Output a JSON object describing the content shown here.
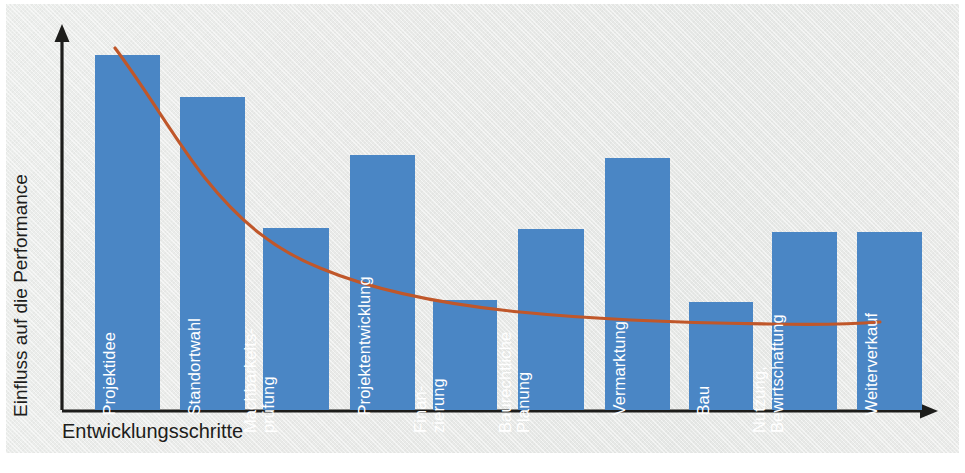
{
  "figure": {
    "background_color": "#e8e9e7",
    "bar_color": "#4a86c5",
    "curve_color": "#c0572a",
    "axis_color": "#1d1d1b",
    "label_color": "#ffffff"
  },
  "axes": {
    "ylabel": "Einfluss auf die Performance",
    "xlabel": "Entwicklungsschritte"
  },
  "chart_data": {
    "type": "bar",
    "title": "",
    "xlabel": "Entwicklungsschritte",
    "ylabel": "Einfluss auf die Performance",
    "grid": false,
    "legend": false,
    "ylim": [
      0,
      100
    ],
    "categories": [
      "Projektidee",
      "Standortwahl",
      "Machbarkeits-\nprüfung",
      "Projektentwicklung",
      "Finan-\nzierung",
      "Baurechtliche\nPlanung",
      "Vermarktung",
      "Bau",
      "Nutzung,\nBewirtschaftung",
      "Weiterverkauf"
    ],
    "values": [
      92,
      81,
      47,
      66,
      29,
      47,
      66,
      28,
      46,
      46
    ],
    "series": [
      {
        "name": "Einfluss auf die Performance",
        "values": [
          92,
          81,
          47,
          66,
          29,
          47,
          66,
          28,
          46,
          46
        ]
      }
    ],
    "overlay_curve": {
      "name": "Abnehmende Einflussmöglichkeit",
      "type": "line",
      "color": "#c0572a",
      "points": [
        [
          0.35,
          100
        ],
        [
          1.0,
          76
        ],
        [
          1.8,
          56
        ],
        [
          2.8,
          43
        ],
        [
          4.0,
          34
        ],
        [
          5.2,
          29
        ],
        [
          6.4,
          26
        ],
        [
          7.6,
          25
        ],
        [
          8.6,
          25
        ],
        [
          9.3,
          26
        ]
      ]
    }
  },
  "bars": [
    {
      "label": "Projektidee",
      "x": 95,
      "width": 65,
      "top": 55,
      "lines": 1,
      "label_x": 118,
      "label_y": 398
    },
    {
      "label": "Standortwahl",
      "x": 180,
      "width": 65,
      "top": 97,
      "lines": 1,
      "label_x": 203,
      "label_y": 398
    },
    {
      "label": "Machbarkeits-\nprüfung",
      "x": 263,
      "width": 66,
      "top": 228,
      "lines": 2,
      "label_x": 277,
      "label_y": 398
    },
    {
      "label": "Projektentwicklung",
      "x": 350,
      "width": 65,
      "top": 155,
      "lines": 1,
      "label_x": 373,
      "label_y": 398
    },
    {
      "label": "Finan-\nzierung",
      "x": 433,
      "width": 64,
      "top": 300,
      "lines": 2,
      "label_x": 447,
      "label_y": 398
    },
    {
      "label": "Baurechtliche\nPlanung",
      "x": 518,
      "width": 66,
      "top": 229,
      "lines": 2,
      "label_x": 532,
      "label_y": 398
    },
    {
      "label": "Vermarktung",
      "x": 605,
      "width": 65,
      "top": 158,
      "lines": 1,
      "label_x": 628,
      "label_y": 398
    },
    {
      "label": "Bau",
      "x": 689,
      "width": 64,
      "top": 302,
      "lines": 1,
      "label_x": 712,
      "label_y": 398
    },
    {
      "label": "Nutzung,\nBewirtschaftung",
      "x": 772,
      "width": 65,
      "top": 232,
      "lines": 2,
      "label_x": 786,
      "label_y": 398
    },
    {
      "label": "Weiterverkauf",
      "x": 857,
      "width": 65,
      "top": 232,
      "lines": 1,
      "label_x": 880,
      "label_y": 398
    }
  ]
}
